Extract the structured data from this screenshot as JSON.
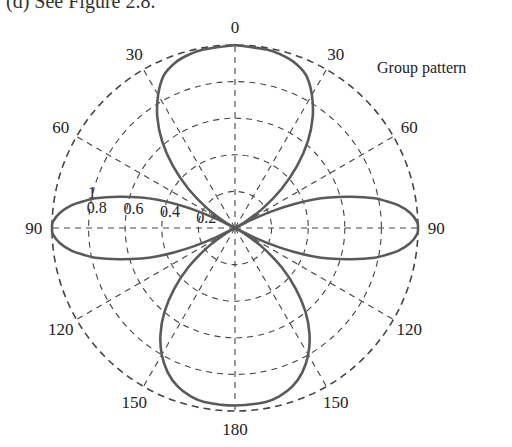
{
  "caption": "(d) See Figure 2.8.",
  "legend_label": "Group pattern",
  "colors": {
    "curve": "#5a5a5a",
    "grid": "#444444",
    "text": "#222222"
  },
  "chart_data": {
    "type": "polar",
    "title": "",
    "series": [
      {
        "name": "Group pattern",
        "angle_unit": "degrees, 0 at top, symmetric about vertical axis",
        "theta": [
          0,
          10,
          15,
          20,
          25,
          30,
          35,
          40,
          45,
          50,
          55,
          60,
          62,
          64,
          66,
          68,
          70,
          72,
          75,
          78,
          80,
          82,
          85,
          88,
          90,
          92,
          95,
          98,
          100,
          102,
          105,
          108,
          110,
          112,
          114,
          116,
          118,
          120,
          125,
          130,
          135,
          140,
          145,
          150,
          155,
          160,
          165,
          170,
          180
        ],
        "r": [
          1.0,
          0.99,
          0.98,
          0.96,
          0.92,
          0.84,
          0.74,
          0.62,
          0.48,
          0.33,
          0.18,
          0.05,
          0.0,
          0.12,
          0.24,
          0.35,
          0.45,
          0.54,
          0.66,
          0.78,
          0.84,
          0.9,
          0.96,
          0.995,
          1.0,
          0.995,
          0.96,
          0.9,
          0.84,
          0.78,
          0.66,
          0.54,
          0.45,
          0.35,
          0.24,
          0.12,
          0.0,
          0.05,
          0.18,
          0.33,
          0.47,
          0.6,
          0.71,
          0.8,
          0.87,
          0.92,
          0.95,
          0.965,
          0.97
        ]
      }
    ],
    "angular_ticks": [
      {
        "angle": 0,
        "label": "0"
      },
      {
        "angle": 30,
        "label": "30"
      },
      {
        "angle": -30,
        "label": "30"
      },
      {
        "angle": 60,
        "label": "60"
      },
      {
        "angle": -60,
        "label": "60"
      },
      {
        "angle": 90,
        "label": "90"
      },
      {
        "angle": -90,
        "label": "90"
      },
      {
        "angle": 120,
        "label": "120"
      },
      {
        "angle": -120,
        "label": "120"
      },
      {
        "angle": 150,
        "label": "150"
      },
      {
        "angle": -150,
        "label": "150"
      },
      {
        "angle": 180,
        "label": "180"
      }
    ],
    "radial_ticks": [
      0.2,
      0.4,
      0.6,
      0.8,
      1
    ],
    "radial_tick_labels": [
      "0.2",
      "0.4",
      "0.6",
      "0.8",
      "1"
    ],
    "rlim": [
      0,
      1
    ],
    "grid": true,
    "legend_position": "upper right"
  }
}
